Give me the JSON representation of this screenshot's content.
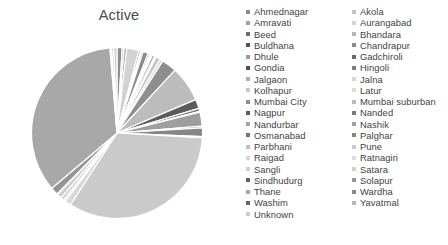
{
  "chart": {
    "title": "Active"
  },
  "chart_data": {
    "type": "pie",
    "title": "Active",
    "xlabel": "",
    "ylabel": "",
    "legend_position": "right",
    "grid": false,
    "start_angle_deg": 0,
    "direction": "clockwise",
    "categories": [
      "Ahmednagar",
      "Akola",
      "Amravati",
      "Aurangabad",
      "Beed",
      "Bhandara",
      "Buldhana",
      "Chandrapur",
      "Dhule",
      "Gadchiroli",
      "Gondia",
      "Hingoli",
      "Jalgaon",
      "Jalna",
      "Kolhapur",
      "Latur",
      "Mumbai City",
      "Mumbai suburban",
      "Nagpur",
      "Nanded",
      "Nandurbar",
      "Nashik",
      "Osmanabad",
      "Palghar",
      "Parbhani",
      "Pune",
      "Raigad",
      "Ratnagiri",
      "Sangli",
      "Satara",
      "Sindhudurg",
      "Solapur",
      "Thane",
      "Wardha",
      "Washim",
      "Yavatmal",
      "Unknown"
    ],
    "values": [
      0.9,
      0.35,
      0.45,
      2.1,
      0.3,
      0.2,
      0.25,
      0.9,
      0.3,
      0.15,
      0.2,
      0.12,
      0.5,
      0.22,
      0.8,
      0.55,
      2.6,
      6.2,
      1.6,
      0.5,
      0.18,
      2.4,
      0.3,
      1.5,
      0.22,
      30.5,
      1.1,
      0.35,
      0.55,
      0.85,
      0.12,
      1.3,
      32.0,
      0.2,
      0.12,
      0.35,
      0.55
    ],
    "colors": [
      "#8c8c8c",
      "#c4c4c4",
      "#a0a0a0",
      "#d2d2d2",
      "#6e6e6e",
      "#b6b6b6",
      "#545454",
      "#8a8a8a",
      "#9a9a9a",
      "#6a6a6a",
      "#4f4f4f",
      "#7e7e7e",
      "#b0b0b0",
      "#d6d6d6",
      "#c8c8c8",
      "#dcdcdc",
      "#8e8e8e",
      "#bcbcbc",
      "#5c5c5c",
      "#7a7a7a",
      "#a6a6a6",
      "#9e9e9e",
      "#727272",
      "#868686",
      "#c0c0c0",
      "#cacaca",
      "#d8d8d8",
      "#dedede",
      "#d0d0d0",
      "#cecece",
      "#606060",
      "#949494",
      "#a8a8a8",
      "#8a8a8a",
      "#666666",
      "#b8b8b8",
      "#cccccc"
    ],
    "units": "percent"
  },
  "legend": {
    "column1": [
      {
        "label": "Ahmednagar",
        "color": "#8c8c8c"
      },
      {
        "label": "Amravati",
        "color": "#a0a0a0"
      },
      {
        "label": "Beed",
        "color": "#6e6e6e"
      },
      {
        "label": "Buldhana",
        "color": "#545454"
      },
      {
        "label": "Dhule",
        "color": "#9a9a9a"
      },
      {
        "label": "Gondia",
        "color": "#4f4f4f"
      },
      {
        "label": "Jalgaon",
        "color": "#b0b0b0"
      },
      {
        "label": "Kolhapur",
        "color": "#c8c8c8"
      },
      {
        "label": "Mumbai City",
        "color": "#8e8e8e"
      },
      {
        "label": "Nagpur",
        "color": "#5c5c5c"
      },
      {
        "label": "Nandurbar",
        "color": "#a6a6a6"
      },
      {
        "label": "Osmanabad",
        "color": "#727272"
      },
      {
        "label": "Parbhani",
        "color": "#c0c0c0"
      },
      {
        "label": "Raigad",
        "color": "#d8d8d8"
      },
      {
        "label": "Sangli",
        "color": "#d0d0d0"
      },
      {
        "label": "Sindhudurg",
        "color": "#606060"
      },
      {
        "label": "Thane",
        "color": "#a8a8a8"
      },
      {
        "label": "Washim",
        "color": "#666666"
      },
      {
        "label": "Unknown",
        "color": "#cccccc"
      }
    ],
    "column2": [
      {
        "label": "Akola",
        "color": "#c4c4c4"
      },
      {
        "label": "Aurangabad",
        "color": "#d2d2d2"
      },
      {
        "label": "Bhandara",
        "color": "#b6b6b6"
      },
      {
        "label": "Chandrapur",
        "color": "#8a8a8a"
      },
      {
        "label": "Gadchiroli",
        "color": "#6a6a6a"
      },
      {
        "label": "Hingoli",
        "color": "#7e7e7e"
      },
      {
        "label": "Jalna",
        "color": "#d6d6d6"
      },
      {
        "label": "Latur",
        "color": "#dcdcdc"
      },
      {
        "label": "Mumbai suburban",
        "color": "#bcbcbc"
      },
      {
        "label": "Nanded",
        "color": "#7a7a7a"
      },
      {
        "label": "Nashik",
        "color": "#9e9e9e"
      },
      {
        "label": "Palghar",
        "color": "#868686"
      },
      {
        "label": "Pune",
        "color": "#cacaca"
      },
      {
        "label": "Ratnagiri",
        "color": "#dedede"
      },
      {
        "label": "Satara",
        "color": "#cecece"
      },
      {
        "label": "Solapur",
        "color": "#949494"
      },
      {
        "label": "Wardha",
        "color": "#8a8a8a"
      },
      {
        "label": "Yavatmal",
        "color": "#b8b8b8"
      }
    ]
  }
}
